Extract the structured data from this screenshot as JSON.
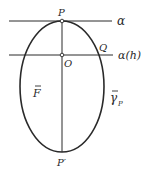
{
  "diagram": {
    "colors": {
      "stroke": "#2a2a2a",
      "background": "#ffffff"
    },
    "lines": {
      "alpha": {
        "label": "α",
        "y": 21
      },
      "alpha_h": {
        "label": "α(h)",
        "y": 55
      }
    },
    "points": {
      "P": {
        "label": "P",
        "x": 62,
        "y": 21
      },
      "O": {
        "label": "O",
        "x": 62,
        "y": 55
      },
      "Q": {
        "label": "Q",
        "x": 99,
        "y": 55
      },
      "P_prime": {
        "label": "P′",
        "x": 62,
        "y": 152
      }
    },
    "regions": {
      "F": {
        "label": "F"
      },
      "gamma": {
        "label": "γ",
        "subscript": "P"
      }
    },
    "ellipse": {
      "cx": 62,
      "cy": 86.5,
      "rx": 42,
      "ry": 65.5
    }
  }
}
